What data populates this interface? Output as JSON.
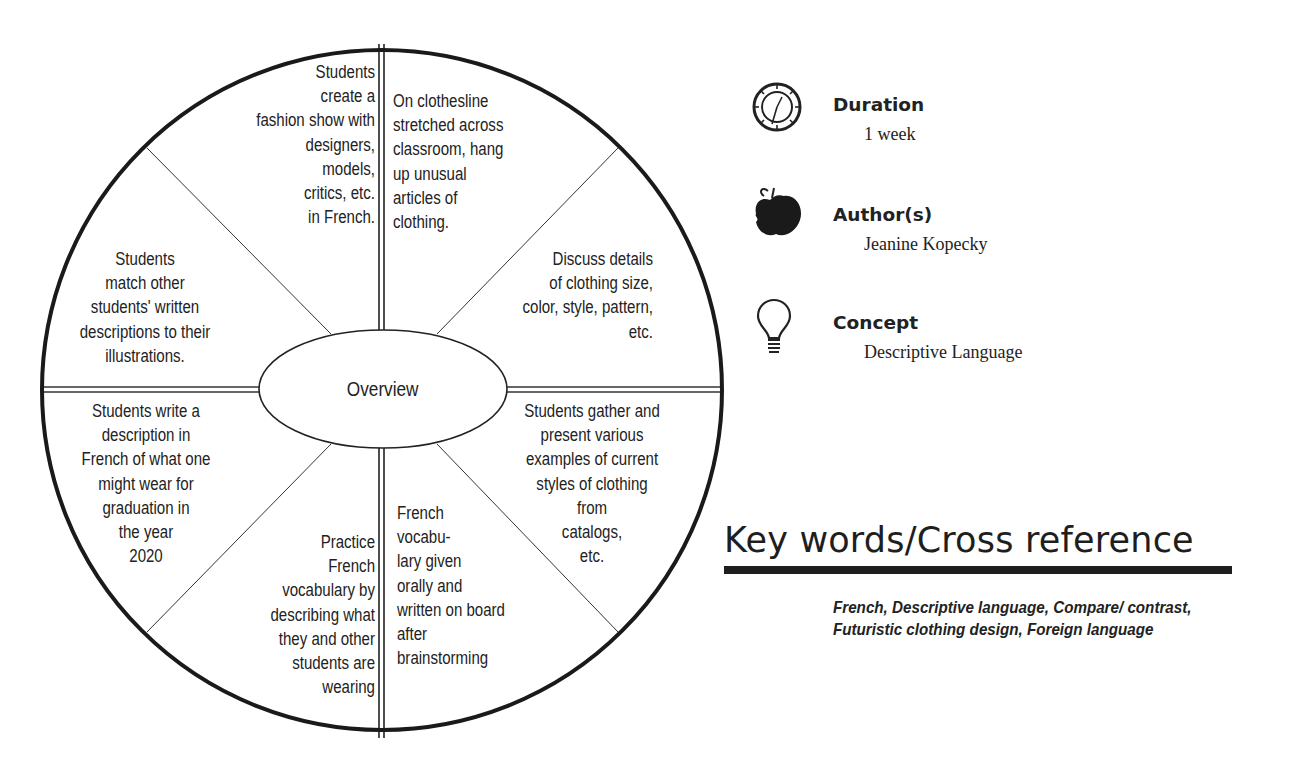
{
  "wheel": {
    "center_label": "Overview",
    "segments": [
      {
        "position": "top-left-inner",
        "text": "Students\ncreate a\nfashion show with\ndesigners,\nmodels,\ncritics, etc.\nin French."
      },
      {
        "position": "top-right-inner",
        "text": "On clothesline\nstretched across\nclassroom, hang\nup unusual\narticles of\nclothing."
      },
      {
        "position": "right-upper",
        "text": "Discuss details\nof clothing size,\ncolor, style, pattern,\netc."
      },
      {
        "position": "right-lower",
        "text": "Students gather and\npresent various\nexamples of current\nstyles of clothing\nfrom\ncatalogs,\netc."
      },
      {
        "position": "bottom-right-inner",
        "text": "French\nvocabu-\nlary given\norally and\nwritten on board\nafter\nbrainstorming"
      },
      {
        "position": "bottom-left-inner",
        "text": "Practice\nFrench\nvocabulary by\ndescribing what\nthey and other\nstudents are\nwearing"
      },
      {
        "position": "left-lower",
        "text": "Students write a\ndescription in\nFrench of what one\nmight wear for\ngraduation in\nthe year\n2020"
      },
      {
        "position": "left-upper",
        "text": "Students\nmatch other\nstudents' written\ndescriptions to their\nillustrations."
      }
    ]
  },
  "info": {
    "duration": {
      "label": "Duration",
      "value": "1 week",
      "icon": "clock-icon"
    },
    "authors": {
      "label": "Author(s)",
      "value": "Jeanine Kopecky",
      "icon": "apple-icon"
    },
    "concept": {
      "label": "Concept",
      "value": "Descriptive Language",
      "icon": "lightbulb-icon"
    }
  },
  "keywords": {
    "title": "Key words/Cross reference",
    "text": "French, Descriptive language, Compare/ contrast, Futuristic clothing design, Foreign language"
  }
}
